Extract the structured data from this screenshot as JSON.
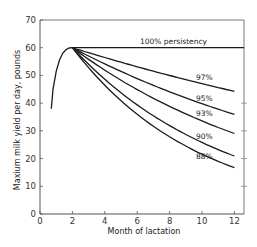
{
  "chart_data": {
    "type": "line",
    "title": "",
    "xlabel": "Month of lactation",
    "ylabel": "Maxium milk yield per day, pounds",
    "xlim": [
      0,
      12.6
    ],
    "ylim": [
      0,
      70
    ],
    "xticks": [
      0,
      2,
      4,
      6,
      8,
      10,
      12
    ],
    "yticks": [
      0,
      10,
      20,
      30,
      40,
      50,
      60,
      70
    ],
    "grid": false,
    "legend": "none (inline labels)",
    "rise": {
      "x": [
        0.7,
        0.8,
        1.0,
        1.2,
        1.4,
        1.6,
        1.8,
        2.0
      ],
      "y": [
        38,
        45,
        51.5,
        55.5,
        58,
        59.3,
        59.9,
        60
      ]
    },
    "peak": {
      "month": 2,
      "yield": 60
    },
    "series": [
      {
        "name": "100% persistency",
        "persistency": 1.0,
        "x": [
          2,
          4,
          6,
          8,
          10,
          12
        ],
        "y": [
          60,
          60,
          60,
          60,
          60,
          60
        ]
      },
      {
        "name": "97%",
        "persistency": 0.97,
        "x": [
          2,
          4,
          6,
          8,
          10,
          12
        ],
        "y": [
          60,
          56.5,
          53.1,
          50.0,
          47.0,
          44.2
        ]
      },
      {
        "name": "95%",
        "persistency": 0.95,
        "x": [
          2,
          4,
          6,
          8,
          10,
          12
        ],
        "y": [
          60,
          54.2,
          48.9,
          44.1,
          39.8,
          35.9
        ]
      },
      {
        "name": "93%",
        "persistency": 0.93,
        "x": [
          2,
          4,
          6,
          8,
          10,
          12
        ],
        "y": [
          60,
          51.9,
          44.9,
          38.8,
          33.6,
          29.0
        ]
      },
      {
        "name": "90%",
        "persistency": 0.9,
        "x": [
          2,
          4,
          6,
          8,
          10,
          12
        ],
        "y": [
          60,
          48.6,
          39.4,
          31.9,
          25.8,
          20.9
        ]
      },
      {
        "name": "88%",
        "persistency": 0.88,
        "x": [
          2,
          4,
          6,
          8,
          10,
          12
        ],
        "y": [
          60,
          46.5,
          36.0,
          27.9,
          21.6,
          16.7
        ]
      }
    ],
    "annotations": [
      {
        "text": "100% persistency",
        "x": 7.2,
        "y": 61.5
      },
      {
        "text": "97%",
        "x": 10.6,
        "y": 49
      },
      {
        "text": "95%",
        "x": 10.6,
        "y": 42
      },
      {
        "text": "93%",
        "x": 10.6,
        "y": 36.5
      },
      {
        "text": "90%",
        "x": 10.6,
        "y": 28
      },
      {
        "text": "88%",
        "x": 10.6,
        "y": 21
      }
    ]
  },
  "labels": {
    "xlabel": "Month of lactation",
    "ylabel": "Maxium milk yield per day, pounds",
    "line_100": "100% persistency",
    "line_97": "97%",
    "line_95": "95%",
    "line_93": "93%",
    "line_90": "90%",
    "line_88": "88%"
  },
  "colors": {
    "line": "#1a1a1a",
    "axis": "#555555",
    "background": "#ffffff"
  }
}
